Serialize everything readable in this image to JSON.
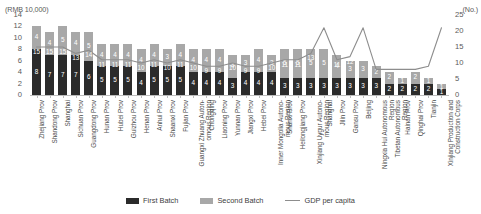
{
  "chart_data": {
    "type": "bar",
    "title": "",
    "subtitle": "",
    "xlabel": "",
    "ylabel": "(RMB 10,000)",
    "y2label": "(No.)",
    "ylim": [
      0,
      14
    ],
    "y2lim": [
      0,
      25
    ],
    "yticks": [
      "0",
      "2",
      "4",
      "6",
      "8",
      "10",
      "12",
      "14"
    ],
    "y2ticks": [
      "0",
      "5",
      "10",
      "15",
      "20",
      "25"
    ],
    "grid": false,
    "legend_position": "bottom",
    "stacked": true,
    "categories": [
      "Zhejiang Prov",
      "Shandong Prov",
      "Shanghai",
      "Sichuan Prov",
      "Guangdong Prov",
      "Hunan Prov",
      "Hubei Prov",
      "Guizhou Prov",
      "Henan Prov",
      "Anhui Prov",
      "Shaanxi Prov",
      "Fujian Prov",
      "Guangxi Zhuang Autonomous Region",
      "Chongqing",
      "Liaoning Prov",
      "Yunnan Prov",
      "Jiangxi Prov",
      "Hebei Prov",
      "Inner Mongolia Autonomous Region",
      "Shanxi Prov",
      "Heilongjiang Prov",
      "Xinjiang Uygur Autonomous Region",
      "Shanghai",
      "Jilin Prov",
      "Gansu Prov",
      "Beijing",
      "Ningxia Hui Autonomous Region",
      "Tibetan Autonomous Region",
      "Hainan Prov",
      "Qinghai Prov",
      "Tianjin",
      "Xinjiang Production and Construction Corps"
    ],
    "series": [
      {
        "name": "First Batch",
        "color": "#2b2b2b",
        "values": [
          8,
          7,
          7,
          7,
          6,
          5,
          5,
          5,
          4,
          5,
          5,
          5,
          4,
          4,
          4,
          3,
          4,
          4,
          4,
          3,
          3,
          3,
          3,
          3,
          3,
          3,
          3,
          2,
          2,
          2,
          2,
          1
        ]
      },
      {
        "name": "Second Batch",
        "color": "#a8a8a8",
        "values": [
          4,
          4,
          5,
          4,
          5,
          4,
          4,
          4,
          4,
          4,
          3,
          4,
          4,
          4,
          4,
          4,
          3,
          4,
          3,
          5,
          5,
          5,
          5,
          4,
          3,
          3,
          2,
          2,
          1,
          2,
          1,
          1
        ]
      }
    ],
    "line_series": {
      "name": "GDP per capita",
      "color": "#8d8d8d",
      "values": [
        15,
        15,
        15,
        13,
        14,
        11,
        11,
        11,
        10,
        11,
        10,
        11,
        10,
        9,
        9,
        10,
        9,
        9,
        10,
        11,
        11,
        13,
        21,
        11,
        12,
        21,
        8,
        8,
        8,
        8,
        9,
        21
      ],
      "labels": [
        "15",
        "15",
        "15",
        "13",
        "14",
        "11",
        "11",
        "11",
        "10",
        "11",
        "10",
        "11",
        "10",
        "9",
        "9",
        "10",
        "9",
        "9",
        "10",
        "11",
        "11",
        "13",
        "",
        "11",
        "12",
        "",
        "",
        "",
        "",
        "",
        "",
        ""
      ]
    }
  },
  "legend": {
    "items": [
      {
        "label": "First Batch",
        "swatch": "first"
      },
      {
        "label": "Second Batch",
        "swatch": "second"
      },
      {
        "label": "GDP per capita",
        "swatch": "line"
      }
    ]
  }
}
